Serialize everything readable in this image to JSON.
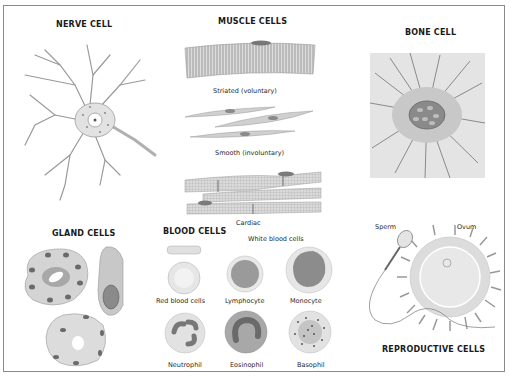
{
  "figure": {
    "sections": {
      "nerve": {
        "title": "NERVE CELL"
      },
      "muscle": {
        "title": "MUSCLE CELLS",
        "types": [
          "Striated (voluntary)",
          "Smooth (involuntary)",
          "Cardiac"
        ]
      },
      "bone": {
        "title": "BONE CELL"
      },
      "gland": {
        "title": "GLAND CELLS"
      },
      "blood": {
        "title": "BLOOD CELLS",
        "white_header": "White blood cells",
        "cells": [
          "Red blood cells",
          "Lymphocyte",
          "Monocyte",
          "Neutrophil",
          "Eosinophil",
          "Basophil"
        ]
      },
      "reproductive": {
        "title": "REPRODUCTIVE CELLS",
        "labels": [
          "Sperm",
          "Ovum"
        ]
      }
    },
    "colors": {
      "frame": "#8a8a8a",
      "cytoplasm": "#d9d9d9",
      "nucleus": "#7a7a7a",
      "line": "#8c8c8c"
    }
  }
}
